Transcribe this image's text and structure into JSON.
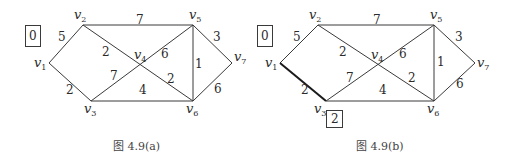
{
  "figures": [
    {
      "id": "a",
      "caption": "图 4.9(a)",
      "vertices": [
        {
          "name": "v",
          "sub": "1",
          "x": 49,
          "y": 63,
          "lx": 34,
          "ly": 67
        },
        {
          "name": "v",
          "sub": "2",
          "x": 83,
          "y": 25,
          "lx": 74,
          "ly": 19
        },
        {
          "name": "v",
          "sub": "3",
          "x": 91,
          "y": 101,
          "lx": 84,
          "ly": 113
        },
        {
          "name": "v",
          "sub": "4",
          "x": 141,
          "y": 65,
          "lx": 134,
          "ly": 59
        },
        {
          "name": "v",
          "sub": "5",
          "x": 193,
          "y": 25,
          "lx": 189,
          "ly": 19
        },
        {
          "name": "v",
          "sub": "6",
          "x": 193,
          "y": 101,
          "lx": 186,
          "ly": 113
        },
        {
          "name": "v",
          "sub": "7",
          "x": 232,
          "y": 63,
          "lx": 234,
          "ly": 61
        }
      ],
      "edges": [
        {
          "from": "v1",
          "to": "v2",
          "weight": "5",
          "wx": 58,
          "wy": 41
        },
        {
          "from": "v1",
          "to": "v3",
          "weight": "2",
          "wx": 66,
          "wy": 94
        },
        {
          "from": "v2",
          "to": "v5",
          "weight": "7",
          "wx": 136,
          "wy": 24
        },
        {
          "from": "v2",
          "to": "v6",
          "weight": "2",
          "wx": 102,
          "wy": 56
        },
        {
          "from": "v3",
          "to": "v5",
          "weight": "7",
          "wx": 110,
          "wy": 80
        },
        {
          "from": "v5",
          "to": "v4",
          "weight": "6",
          "wx": 161,
          "wy": 58
        },
        {
          "from": "v4",
          "to": "v6",
          "weight": "2",
          "wx": 167,
          "wy": 83
        },
        {
          "from": "v3",
          "to": "v6",
          "weight": "4",
          "wx": 139,
          "wy": 94
        },
        {
          "from": "v5",
          "to": "v6",
          "weight": "1",
          "wx": 195,
          "wy": 68
        },
        {
          "from": "v5",
          "to": "v7",
          "weight": "3",
          "wx": 213,
          "wy": 41
        },
        {
          "from": "v6",
          "to": "v7",
          "weight": "6",
          "wx": 214,
          "wy": 93
        }
      ],
      "labels": [
        {
          "text": "0",
          "x": 25,
          "y": 25,
          "w": 16,
          "h": 22
        }
      ]
    },
    {
      "id": "b",
      "caption": "图 4.9(b)",
      "vertices": [
        {
          "name": "v",
          "sub": "1",
          "x": 280,
          "y": 63,
          "lx": 265,
          "ly": 67
        },
        {
          "name": "v",
          "sub": "2",
          "x": 318,
          "y": 25,
          "lx": 309,
          "ly": 19
        },
        {
          "name": "v",
          "sub": "3",
          "x": 326,
          "y": 101,
          "lx": 314,
          "ly": 113
        },
        {
          "name": "v",
          "sub": "4",
          "x": 378,
          "y": 65,
          "lx": 371,
          "ly": 59
        },
        {
          "name": "v",
          "sub": "5",
          "x": 434,
          "y": 25,
          "lx": 430,
          "ly": 19
        },
        {
          "name": "v",
          "sub": "6",
          "x": 434,
          "y": 101,
          "lx": 427,
          "ly": 113
        },
        {
          "name": "v",
          "sub": "7",
          "x": 475,
          "y": 63,
          "lx": 477,
          "ly": 67
        }
      ],
      "edges": [
        {
          "from": "v1",
          "to": "v2",
          "weight": "5",
          "wx": 293,
          "wy": 41,
          "bold": false
        },
        {
          "from": "v1",
          "to": "v3",
          "weight": "2",
          "wx": 301,
          "wy": 94,
          "bold": true
        },
        {
          "from": "v2",
          "to": "v5",
          "weight": "7",
          "wx": 373,
          "wy": 24,
          "bold": false
        },
        {
          "from": "v2",
          "to": "v6",
          "weight": "2",
          "wx": 339,
          "wy": 56,
          "bold": false
        },
        {
          "from": "v3",
          "to": "v5",
          "weight": "7",
          "wx": 346,
          "wy": 82,
          "bold": false
        },
        {
          "from": "v5",
          "to": "v4",
          "weight": "6",
          "wx": 399,
          "wy": 58,
          "bold": false
        },
        {
          "from": "v4",
          "to": "v6",
          "weight": "2",
          "wx": 408,
          "wy": 82,
          "bold": false
        },
        {
          "from": "v3",
          "to": "v6",
          "weight": "4",
          "wx": 379,
          "wy": 94,
          "bold": false
        },
        {
          "from": "v5",
          "to": "v6",
          "weight": "1",
          "wx": 437,
          "wy": 66,
          "bold": false
        },
        {
          "from": "v5",
          "to": "v7",
          "weight": "3",
          "wx": 455,
          "wy": 41,
          "bold": false
        },
        {
          "from": "v6",
          "to": "v7",
          "weight": "6",
          "wx": 456,
          "wy": 88,
          "bold": false
        }
      ],
      "labels": [
        {
          "text": "0",
          "x": 257,
          "y": 25,
          "w": 16,
          "h": 22
        },
        {
          "text": "2",
          "x": 326,
          "y": 111,
          "w": 17,
          "h": 17
        }
      ]
    }
  ]
}
